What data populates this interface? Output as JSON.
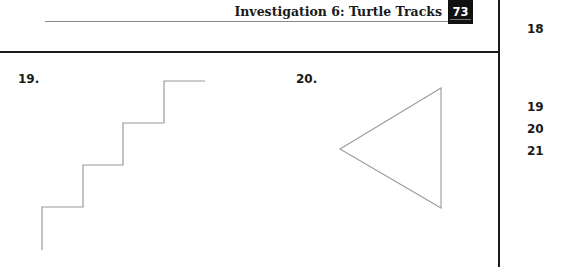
{
  "header": {
    "title": "Investigation 6: Turtle Tracks",
    "page_number": "73"
  },
  "problems": [
    {
      "number": "19.",
      "figure": "staircase"
    },
    {
      "number": "20.",
      "figure": "triangle"
    }
  ],
  "margin_numbers": [
    "18",
    "19",
    "20",
    "21"
  ],
  "figures": {
    "staircase_points": "42,250 42,207 83,207 83,165 123,165 123,123 164,123 164,81 205,81",
    "triangle_points": "441,88 340,149 441,208",
    "stroke_color": "#9a9a9a"
  }
}
